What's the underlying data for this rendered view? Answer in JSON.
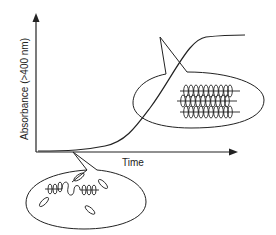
{
  "diagram": {
    "y_axis_label": "Absorbance (>400 nm)",
    "x_axis_label": "Time",
    "curve_shape": "sigmoidal",
    "callouts": [
      {
        "name": "lag-phase-inset",
        "depicts": "monomers and short disordered oligomers"
      },
      {
        "name": "plateau-inset",
        "depicts": "ordered stacked polymer bundles"
      }
    ],
    "colors": {
      "line": "#222222",
      "background": "#ffffff"
    }
  }
}
